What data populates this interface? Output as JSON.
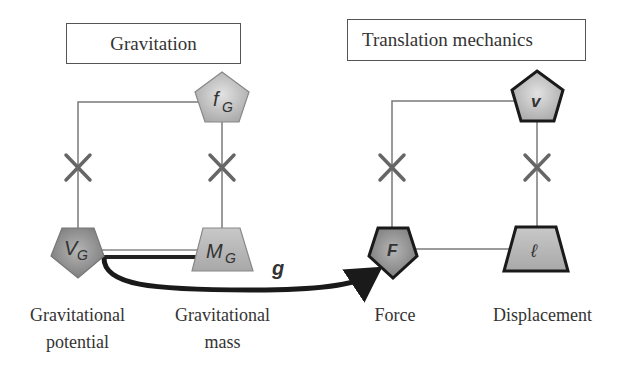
{
  "diagram": {
    "left_panel": {
      "title": "Gravitation",
      "nodes": {
        "top": {
          "symbol": "f",
          "subscript": "G",
          "shape": "pentagon"
        },
        "bottom_left": {
          "symbol": "V",
          "subscript": "G",
          "shape": "pentagon-inverted",
          "label_line1": "Gravitational",
          "label_line2": "potential"
        },
        "bottom_right": {
          "symbol": "M",
          "subscript": "G",
          "shape": "trapezoid",
          "label_line1": "Gravitational",
          "label_line2": "mass"
        }
      }
    },
    "right_panel": {
      "title": "Translation mechanics",
      "nodes": {
        "top": {
          "symbol": "v",
          "shape": "pentagon"
        },
        "bottom_left": {
          "symbol": "F",
          "shape": "pentagon-inverted",
          "label": "Force"
        },
        "bottom_right": {
          "symbol": "ℓ",
          "shape": "trapezoid",
          "label": "Displacement"
        }
      }
    },
    "arrow": {
      "label": "g",
      "from": "V_G",
      "to": "F"
    },
    "colors": {
      "node_fill": "#b0b0b0",
      "node_fill_dark": "#8a8a8a",
      "line": "#777777",
      "arrow": "#1a1a1a",
      "cross": "#666666"
    }
  }
}
